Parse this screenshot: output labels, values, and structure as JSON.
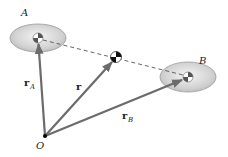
{
  "diagram": {
    "type": "center-of-mass position vectors",
    "bodies": [
      {
        "id": "A",
        "label": "A",
        "center": [
          38,
          38
        ],
        "rx": 28,
        "ry": 14
      },
      {
        "id": "B",
        "label": "B",
        "center": [
          188,
          77
        ],
        "rx": 28,
        "ry": 15
      }
    ],
    "origin": {
      "label": "O",
      "point": [
        45,
        136
      ]
    },
    "center_of_mass": {
      "point": [
        116,
        57
      ]
    },
    "vectors": [
      {
        "id": "rA",
        "label": "r",
        "subscript": "A",
        "from": "O",
        "to": "A"
      },
      {
        "id": "r",
        "label": "r",
        "subscript": "",
        "from": "O",
        "to": "CM"
      },
      {
        "id": "rB",
        "label": "r",
        "subscript": "B",
        "from": "O",
        "to": "B"
      }
    ],
    "dashed_line": {
      "from": "A",
      "to": "B"
    },
    "colors": {
      "vector": "#6b6b6b",
      "ellipse_fill": "#d6d6d6",
      "ellipse_edge": "#9a9a9a",
      "dash": "#555555"
    }
  },
  "labels": {
    "A": "A",
    "B": "B",
    "O": "O",
    "rA_main": "r",
    "rA_sub": "A",
    "r_main": "r",
    "rB_main": "r",
    "rB_sub": "B"
  }
}
